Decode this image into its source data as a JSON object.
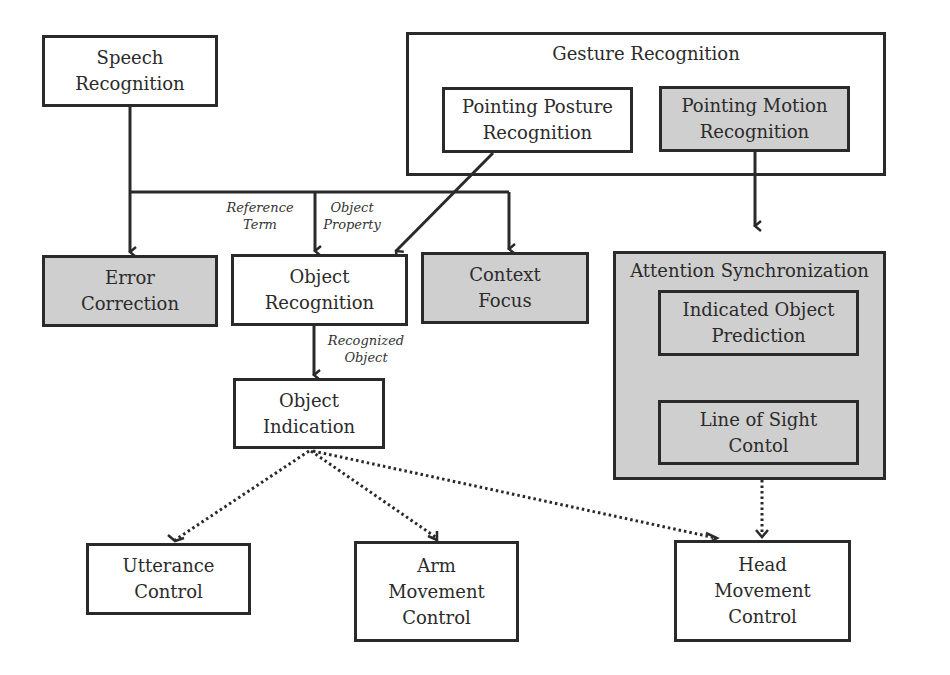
{
  "diagram": {
    "nodes": {
      "speech": "Speech\nRecognition",
      "gesture_group": "Gesture Recognition",
      "posture": "Pointing Posture\nRecognition",
      "motion": "Pointing Motion\nRecognition",
      "error": "Error\nCorrection",
      "objrec": "Object\nRecognition",
      "context": "Context\nFocus",
      "attention_group": "Attention Synchronization",
      "predict": "Indicated Object\nPrediction",
      "sight": "Line of Sight\nContol",
      "objind": "Object\nIndication",
      "utter": "Utterance\nControl",
      "arm": "Arm\nMovement\nControl",
      "head": "Head\nMovement\nControl"
    },
    "edge_labels": {
      "reference_term": "Reference\nTerm",
      "object_property": "Object\nProperty",
      "recognized_object": "Recognized\nObject"
    },
    "edges": [
      {
        "from": "Speech Recognition",
        "to": "Error Correction",
        "style": "solid"
      },
      {
        "from": "Speech Recognition",
        "to": "Object Recognition",
        "style": "solid",
        "label": "Reference Term / Object Property"
      },
      {
        "from": "Speech Recognition",
        "to": "Context Focus",
        "style": "solid"
      },
      {
        "from": "Pointing Posture Recognition",
        "to": "Object Recognition",
        "style": "solid"
      },
      {
        "from": "Pointing Motion Recognition",
        "to": "Attention Synchronization",
        "style": "solid"
      },
      {
        "from": "Indicated Object Prediction",
        "to": "Line of Sight Contol",
        "style": "solid"
      },
      {
        "from": "Object Recognition",
        "to": "Object Indication",
        "style": "solid",
        "label": "Recognized Object"
      },
      {
        "from": "Object Indication",
        "to": "Utterance Control",
        "style": "dotted"
      },
      {
        "from": "Object Indication",
        "to": "Arm Movement Control",
        "style": "dotted"
      },
      {
        "from": "Object Indication",
        "to": "Head Movement Control",
        "style": "dotted"
      },
      {
        "from": "Attention Synchronization",
        "to": "Head Movement Control",
        "style": "dotted"
      }
    ],
    "colors": {
      "stroke": "#2a2a2a",
      "gray_fill": "#cfcfcf",
      "white_fill": "#ffffff"
    }
  }
}
